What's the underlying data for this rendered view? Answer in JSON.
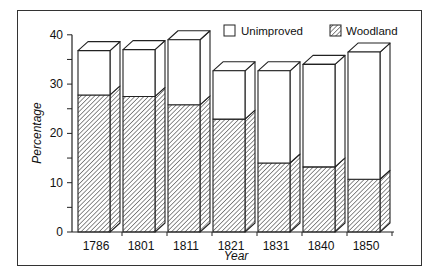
{
  "chart_data": {
    "type": "bar",
    "stacked": true,
    "style": "3d",
    "title": "",
    "xlabel": "Year",
    "ylabel": "Percentage",
    "ylim": [
      0,
      40
    ],
    "yticks": [
      0,
      10,
      20,
      30,
      40
    ],
    "categories": [
      "1786",
      "1801",
      "1811",
      "1821",
      "1831",
      "1840",
      "1850"
    ],
    "series": [
      {
        "name": "Woodland",
        "pattern": "diagonal-hatch",
        "values": [
          27.8,
          27.5,
          25.8,
          22.9,
          14.0,
          13.2,
          10.7
        ]
      },
      {
        "name": "Unimproved",
        "pattern": "white",
        "values": [
          9.0,
          9.5,
          13.2,
          9.8,
          18.7,
          20.8,
          25.8
        ]
      }
    ],
    "totals": [
      36.8,
      37.0,
      39.0,
      32.7,
      32.7,
      34.0,
      36.5
    ],
    "legend": {
      "position": "top-right",
      "entries": [
        "Unimproved",
        "Woodland"
      ]
    },
    "grid": false
  }
}
